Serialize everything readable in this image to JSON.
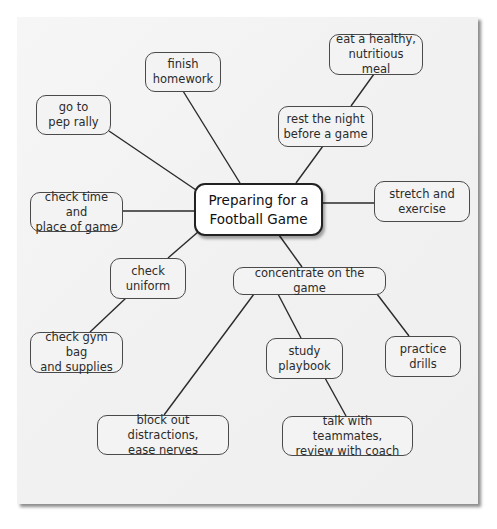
{
  "diagram": {
    "type": "concept-map",
    "center": {
      "id": "center",
      "label": "Preparing for a\nFootball Game"
    },
    "nodes": [
      {
        "id": "finish_homework",
        "label": "finish\nhomework"
      },
      {
        "id": "pep_rally",
        "label": "go to\npep rally"
      },
      {
        "id": "healthy_meal",
        "label": "eat a healthy,\nnutritious meal"
      },
      {
        "id": "rest_night",
        "label": "rest the night\nbefore a game"
      },
      {
        "id": "check_time",
        "label": "check time and\nplace of game"
      },
      {
        "id": "stretch",
        "label": "stretch and\nexercise"
      },
      {
        "id": "check_uniform",
        "label": "check\nuniform"
      },
      {
        "id": "concentrate",
        "label": "concentrate on the game"
      },
      {
        "id": "gym_bag",
        "label": "check gym bag\nand supplies"
      },
      {
        "id": "study_playbook",
        "label": "study\nplaybook"
      },
      {
        "id": "practice_drills",
        "label": "practice\ndrills"
      },
      {
        "id": "block_out",
        "label": "block out distractions,\nease nerves"
      },
      {
        "id": "talk_teammates",
        "label": "talk with teammates,\nreview with coach"
      }
    ],
    "edges": [
      [
        "center",
        "finish_homework"
      ],
      [
        "center",
        "pep_rally"
      ],
      [
        "center",
        "rest_night"
      ],
      [
        "rest_night",
        "healthy_meal"
      ],
      [
        "center",
        "check_time"
      ],
      [
        "center",
        "stretch"
      ],
      [
        "center",
        "check_uniform"
      ],
      [
        "check_uniform",
        "gym_bag"
      ],
      [
        "center",
        "concentrate"
      ],
      [
        "concentrate",
        "block_out"
      ],
      [
        "concentrate",
        "study_playbook"
      ],
      [
        "concentrate",
        "practice_drills"
      ],
      [
        "study_playbook",
        "talk_teammates"
      ]
    ]
  },
  "colors": {
    "paper": "#f3f3f3",
    "node_border": "#4a4a4a",
    "center_fill": "#ffffff",
    "line": "#2a2a2a",
    "text": "#2b2b2b"
  }
}
